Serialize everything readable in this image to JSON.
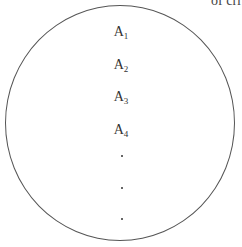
{
  "header_fragment": "of cri",
  "set": {
    "shape": "circle",
    "elements": [
      {
        "base": "A",
        "sub": "1"
      },
      {
        "base": "A",
        "sub": "2"
      },
      {
        "base": "A",
        "sub": "3"
      },
      {
        "base": "A",
        "sub": "4"
      }
    ],
    "continuation": [
      "·",
      "·",
      "·"
    ]
  }
}
